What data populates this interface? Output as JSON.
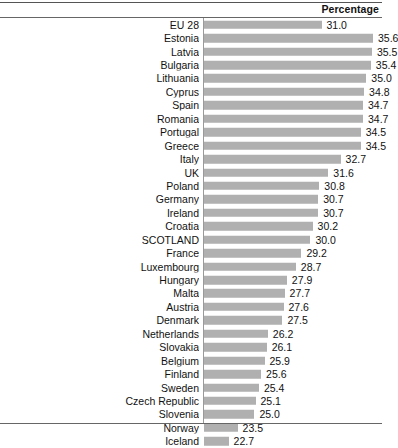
{
  "header": {
    "value_column_title": "Percentage"
  },
  "chart_data": {
    "type": "bar",
    "orientation": "horizontal",
    "title": "",
    "subtitle": "",
    "xlabel": "Percentage",
    "ylabel": "",
    "grid": false,
    "legend": false,
    "value_format": "one-decimal",
    "bar_color": "#b0b0b0",
    "axis_min": 20.5,
    "axis_max": 36.4,
    "categories": [
      "EU 28",
      "Estonia",
      "Latvia",
      "Bulgaria",
      "Lithuania",
      "Cyprus",
      "Spain",
      "Romania",
      "Portugal",
      "Greece",
      "Italy",
      "UK",
      "Poland",
      "Germany",
      "Ireland",
      "Croatia",
      "SCOTLAND",
      "France",
      "Luxembourg",
      "Hungary",
      "Malta",
      "Austria",
      "Denmark",
      "Netherlands",
      "Slovakia",
      "Belgium",
      "Finland",
      "Sweden",
      "Czech Republic",
      "Slovenia",
      "Norway",
      "Iceland"
    ],
    "values": [
      31.0,
      35.6,
      35.5,
      35.4,
      35.0,
      34.8,
      34.7,
      34.7,
      34.5,
      34.5,
      32.7,
      31.6,
      30.8,
      30.7,
      30.7,
      30.2,
      30.0,
      29.2,
      28.7,
      27.9,
      27.7,
      27.6,
      27.5,
      26.2,
      26.1,
      25.9,
      25.6,
      25.4,
      25.1,
      25.0,
      23.5,
      22.7
    ],
    "labels": [
      "31.0",
      "35.6",
      "35.5",
      "35.4",
      "35.0",
      "34.8",
      "34.7",
      "34.7",
      "34.5",
      "34.5",
      "32.7",
      "31.6",
      "30.8",
      "30.7",
      "30.7",
      "30.2",
      "30.0",
      "29.2",
      "28.7",
      "27.9",
      "27.7",
      "27.6",
      "27.5",
      "26.2",
      "26.1",
      "25.9",
      "25.6",
      "25.4",
      "25.1",
      "25.0",
      "23.5",
      "22.7"
    ]
  }
}
